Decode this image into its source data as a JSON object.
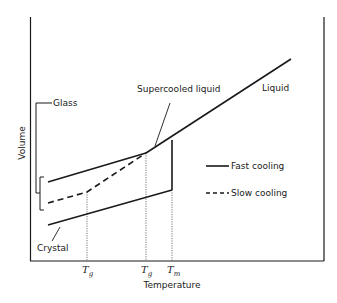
{
  "diagram": {
    "type": "volume-temperature diagram",
    "axes": {
      "x_label": "Temperature",
      "y_label": "Volume"
    },
    "x_ticks": [
      {
        "main": "T",
        "sub": "g",
        "meaning": "glass transition (slow cooling)"
      },
      {
        "main": "T",
        "sub": "g",
        "meaning": "glass transition (fast cooling)"
      },
      {
        "main": "T",
        "sub": "m",
        "meaning": "melting point"
      }
    ],
    "labels": {
      "liquid": "Liquid",
      "supercooled_liquid": "Supercooled liquid",
      "glass": "Glass",
      "crystal": "Crystal"
    },
    "legend": [
      {
        "style": "solid",
        "label": "Fast cooling"
      },
      {
        "style": "dashed",
        "label": "Slow cooling"
      }
    ],
    "colors": {
      "line": "#1a1a1a",
      "background": "#ffffff"
    }
  }
}
